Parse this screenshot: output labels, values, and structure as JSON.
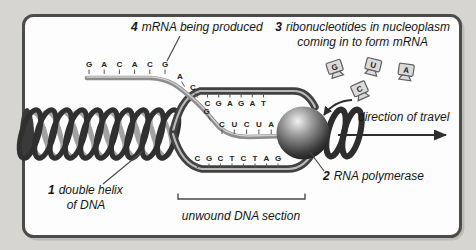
{
  "figure": {
    "labels": {
      "mrna": {
        "num": "4",
        "text": "mRNA being produced"
      },
      "ribo": {
        "num": "3",
        "text": "ribonucleotides in nucleoplasm",
        "text2": "coming in to form mRNA"
      },
      "direction": "direction of travel",
      "polymerase": {
        "num": "2",
        "text": "RNA polymerase"
      },
      "helix": {
        "num": "1",
        "text": "double helix",
        "text2": "of DNA"
      },
      "unwound": "unwound DNA section"
    },
    "sequences": {
      "mrna_tail": [
        "G",
        "A",
        "C",
        "A",
        "C",
        "G"
      ],
      "mrna_descent": [
        "A",
        "C"
      ],
      "mrna_start": "G",
      "mrna_new": [
        "C",
        "U",
        "C",
        "U",
        "A"
      ],
      "coding_strand": [
        "C",
        "G",
        "A",
        "G",
        "A",
        "T"
      ],
      "template_strand": [
        "C",
        "G",
        "C",
        "T",
        "C",
        "T",
        "A",
        "G"
      ],
      "nucleotides": [
        "G",
        "U",
        "A",
        "C"
      ]
    },
    "colors": {
      "bg": "#d6d5d1",
      "panel": "#fdfdfd",
      "frame": "#4b4b4b",
      "dark": "#303030",
      "mid": "#8d8d8d"
    }
  }
}
